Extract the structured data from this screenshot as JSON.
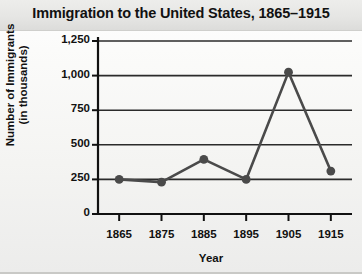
{
  "chart_data": {
    "type": "line",
    "title": "Immigration to the United States, 1865–1915",
    "xlabel": "Year",
    "ylabel_line1": "Number of Immigrants",
    "ylabel_line2": "(in thousands)",
    "categories": [
      "1865",
      "1875",
      "1885",
      "1895",
      "1905",
      "1915"
    ],
    "x": [
      1865,
      1875,
      1885,
      1895,
      1905,
      1915
    ],
    "values": [
      250,
      230,
      395,
      250,
      1025,
      310
    ],
    "series": [
      {
        "name": "Number of Immigrants (in thousands)",
        "values": [
          250,
          230,
          395,
          250,
          1025,
          310
        ]
      }
    ],
    "ylim": [
      0,
      1250
    ],
    "xlim": [
      1860,
      1920
    ],
    "ytick_labels": [
      "0",
      "250",
      "500",
      "750",
      "1,000",
      "1,250"
    ],
    "ytick_values": [
      0,
      250,
      500,
      750,
      1000,
      1250
    ],
    "xtick_labels": [
      "1865",
      "1875",
      "1885",
      "1895",
      "1905",
      "1915"
    ],
    "grid": true,
    "grid_axis": "y",
    "legend": false,
    "legend_position": "none",
    "marker": "circle",
    "colors": {
      "line": "#4a4a4a",
      "marker": "#4a4a4a",
      "grid": "#2b2b2b",
      "axis": "#111111",
      "text": "#111111",
      "background": "#f4f4f2",
      "title_band": "#e6e6e4"
    }
  }
}
